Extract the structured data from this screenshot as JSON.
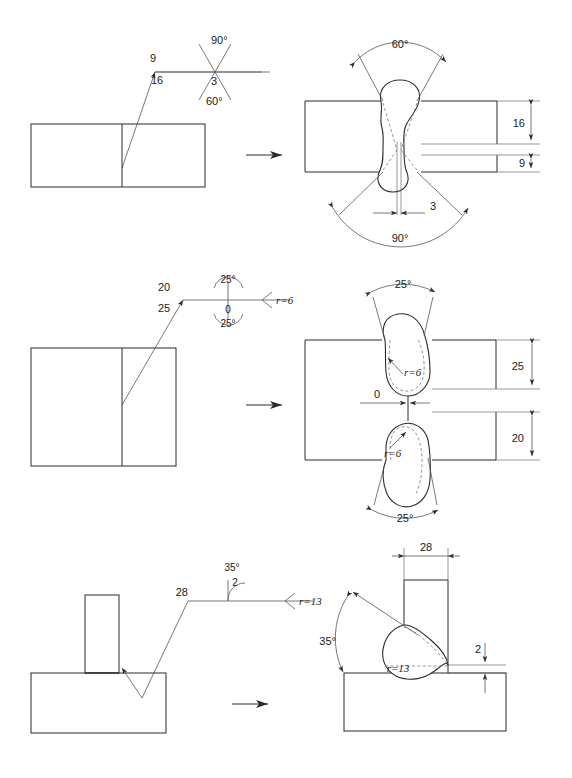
{
  "document": {
    "title": "Welding symbol and weld preparation drawing",
    "type": "technical-drawing",
    "rows": 3
  },
  "row1": {
    "name": "double-V-butt-weld",
    "symbol": {
      "depth_above": "9",
      "depth_below": "16",
      "angle_above": "90°",
      "root_gap": "3",
      "angle_below": "60°"
    },
    "section": {
      "angle_top": "60°",
      "angle_bottom": "90°",
      "root_gap": "3",
      "thickness_upper": "16",
      "thickness_lower": "9"
    }
  },
  "row2": {
    "name": "double-U-butt-weld",
    "symbol": {
      "depth_above": "20",
      "depth_below": "25",
      "angle_above": "25°",
      "root_gap": "0",
      "angle_below": "25°",
      "radius": "r=6"
    },
    "section": {
      "angle_top": "25°",
      "angle_bottom": "25°",
      "root_gap": "0",
      "radius_top": "r=6",
      "radius_bottom": "r=6",
      "thickness_upper": "25",
      "thickness_lower": "20"
    }
  },
  "row3": {
    "name": "single-J-fillet-weld",
    "symbol": {
      "depth": "28",
      "angle": "35°",
      "root_face": "2",
      "radius": "r=13"
    },
    "section": {
      "width": "28",
      "angle": "35°",
      "root_face": "2",
      "radius": "r=13"
    }
  },
  "colors": {
    "line": "#2b2b2b",
    "thin_line": "#555555",
    "dashed_line": "#777777",
    "background": "#ffffff"
  },
  "glyphs": {
    "transform_arrow": "transform-arrow"
  }
}
